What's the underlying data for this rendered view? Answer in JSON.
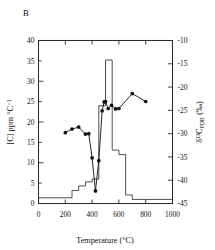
{
  "figure": {
    "panel_label": "B",
    "background": "#ffffff",
    "ink_color": "#111111"
  },
  "chart_data": {
    "type": "line",
    "title": "",
    "subtitle": "",
    "panel": "B",
    "xlabel": "Temperature (°C)",
    "ylabel": "[C] ppm °C⁻¹",
    "y2label": "δ¹³C",
    "y2label_sub": "PDB",
    "y2label_units": "(‰)",
    "xlim": [
      0,
      1000
    ],
    "ylim": [
      0,
      40
    ],
    "y2lim": [
      -45,
      -10
    ],
    "grid": false,
    "legend": "none",
    "xticks": [
      0,
      200,
      400,
      600,
      800,
      1000
    ],
    "xticklabels": [
      "0",
      "200",
      "400",
      "600",
      "800",
      "1000"
    ],
    "yticks": [
      0,
      5,
      10,
      15,
      20,
      25,
      30,
      35,
      40
    ],
    "yticklabels": [
      "0",
      "5",
      "10",
      "15",
      "20",
      "25",
      "30",
      "35",
      "40"
    ],
    "y2ticks": [
      -45,
      -40,
      -35,
      -30,
      -25,
      -20,
      -15,
      -10
    ],
    "y2ticklabels": [
      "-45",
      "-40",
      "-35",
      "-30",
      "-25",
      "-20",
      "-15",
      "-10"
    ],
    "series": [
      {
        "name": "carbon release rate",
        "type": "step",
        "axis": "left",
        "marker": "none",
        "color": "#303030",
        "bin_edges": [
          0,
          200,
          250,
          300,
          350,
          400,
          450,
          500,
          550,
          600,
          650,
          700,
          750,
          800,
          850,
          1000
        ],
        "values": [
          1.4,
          1.4,
          3.2,
          4.3,
          5.3,
          6.0,
          24.0,
          35.2,
          13.1,
          12.0,
          2.1,
          1.0,
          1.0,
          1.0,
          1.0
        ]
      },
      {
        "name": "d13C of released carbon",
        "type": "line+markers",
        "axis": "right",
        "marker": "filled-circle",
        "color": "#101010",
        "x": [
          200,
          250,
          300,
          350,
          375,
          400,
          425,
          450,
          475,
          490,
          500,
          520,
          545,
          575,
          600,
          700,
          800
        ],
        "values": [
          -29.8,
          -29.0,
          -28.6,
          -30.1,
          -30.0,
          -35.2,
          -42.3,
          -35.8,
          -25.1,
          -23.2,
          -23.1,
          -24.6,
          -23.9,
          -24.7,
          -24.6,
          -21.4,
          -23.1
        ]
      }
    ]
  }
}
